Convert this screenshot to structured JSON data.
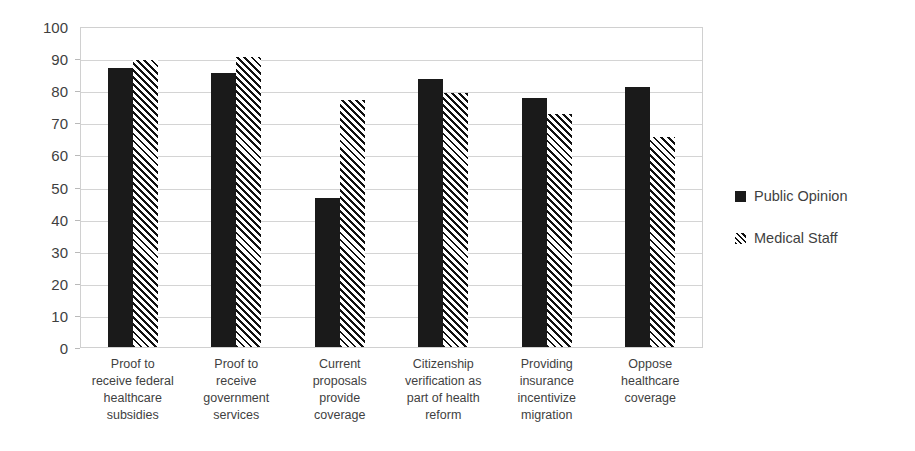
{
  "chart_data": {
    "type": "bar",
    "title": "",
    "subtitle": "",
    "xlabel": "",
    "ylabel": "",
    "ylim": [
      0,
      100
    ],
    "ytick_step": 10,
    "yticks": [
      100,
      90,
      80,
      70,
      60,
      50,
      40,
      30,
      20,
      10,
      0
    ],
    "grid": true,
    "legend_position": "right",
    "categories": [
      "Proof to\nreceive federal\nhealthcare\nsubsidies",
      "Proof to\nreceive\ngovernment\nservices",
      "Current\nproposals\nprovide\ncoverage",
      "Citizenship\nverification as\npart of health\nreform",
      "Providing\ninsurance\nincentivize\nmigration",
      "Oppose\nhealthcare\ncoverage"
    ],
    "series": [
      {
        "name": "Public Opinion",
        "style": "solid",
        "color": "#1a1a1a",
        "values": [
          87,
          85.5,
          46.5,
          83.5,
          77.5,
          81
        ]
      },
      {
        "name": "Medical Staff",
        "style": "hatched",
        "color": "#111111",
        "values": [
          89.5,
          90.5,
          77,
          79,
          72.5,
          65.5
        ]
      }
    ]
  },
  "legend": {
    "items": [
      {
        "label": "Public Opinion",
        "style": "solid"
      },
      {
        "label": "Medical Staff",
        "style": "hatched"
      }
    ]
  },
  "colors": {
    "series_solid": "#1a1a1a",
    "series_hatched": "#111111",
    "gridline": "#d4d4d4",
    "axis_text": "#3f3f3f",
    "background": "#ffffff"
  }
}
